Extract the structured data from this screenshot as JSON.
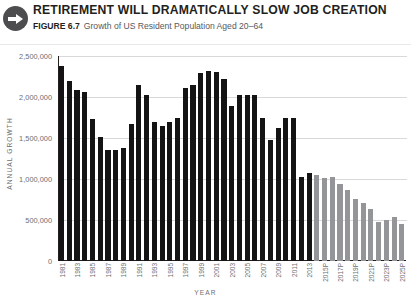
{
  "header": {
    "icon": "right-arrow-circle-icon",
    "title": "RETIREMENT WILL DRAMATICALLY SLOW JOB CREATION",
    "figure_label": "FIGURE 6.7",
    "figure_caption": "Growth of US Resident Population Aged 20–64"
  },
  "colors": {
    "actual_bar": "#141414",
    "projected_bar": "#939598",
    "gridline": "#d9d9d9",
    "axis": "#231f20",
    "tick_text": "#6d6e71",
    "badge": "#4d4d4f"
  },
  "chart_data": {
    "type": "bar",
    "title": "RETIREMENT WILL DRAMATICALLY SLOW JOB CREATION",
    "subtitle": "Growth of US Resident Population Aged 20–64",
    "xlabel": "YEAR",
    "ylabel": "ANNUAL GROWTH",
    "ylim": [
      0,
      2500000
    ],
    "ytick_values": [
      0,
      500000,
      1000000,
      1500000,
      2000000,
      2500000
    ],
    "ytick_labels": [
      "0",
      "500,000",
      "1,000,000",
      "1,500,000",
      "2,000,000",
      "2,500,000"
    ],
    "grid": true,
    "legend": null,
    "xtick_labels_shown_every": 2,
    "categories": [
      "1981",
      "1982",
      "1983",
      "1984",
      "1985",
      "1986",
      "1987",
      "1988",
      "1989",
      "1990",
      "1991",
      "1992",
      "1993",
      "1994",
      "1995",
      "1996",
      "1997",
      "1998",
      "1999",
      "2000",
      "2001",
      "2002",
      "2003",
      "2004",
      "2005",
      "2006",
      "2007",
      "2008",
      "2009",
      "2010",
      "2011",
      "2012",
      "2013",
      "2014P",
      "2015P",
      "2016P",
      "2017P",
      "2018P",
      "2019P",
      "2020P",
      "2021P",
      "2022P",
      "2023P",
      "2024P",
      "2025P"
    ],
    "visible_xtick_labels": [
      "1981",
      "1983",
      "1985",
      "1987",
      "1989",
      "1991",
      "1993",
      "1995",
      "1997",
      "1999",
      "2001",
      "2003",
      "2005",
      "2007",
      "2009",
      "2011",
      "2013",
      "2015P",
      "2017P",
      "2019P",
      "2021P",
      "2023P",
      "2025P"
    ],
    "series": [
      {
        "name": "Annual growth of US resident population aged 20-64",
        "values": [
          2380000,
          2190000,
          2080000,
          2060000,
          1730000,
          1510000,
          1350000,
          1350000,
          1380000,
          1670000,
          2150000,
          2020000,
          1700000,
          1650000,
          1700000,
          1740000,
          2110000,
          2150000,
          2290000,
          2320000,
          2300000,
          2220000,
          1890000,
          2020000,
          2030000,
          2030000,
          1740000,
          1470000,
          1620000,
          1740000,
          1750000,
          1030000,
          1070000,
          1050000,
          1010000,
          1030000,
          940000,
          860000,
          760000,
          710000,
          640000,
          480000,
          500000,
          540000,
          450000
        ],
        "segments": [
          {
            "label": "actual",
            "range": [
              0,
              32
            ],
            "color": "#141414"
          },
          {
            "label": "projected",
            "range": [
              33,
              44
            ],
            "color": "#939598"
          }
        ]
      }
    ]
  }
}
